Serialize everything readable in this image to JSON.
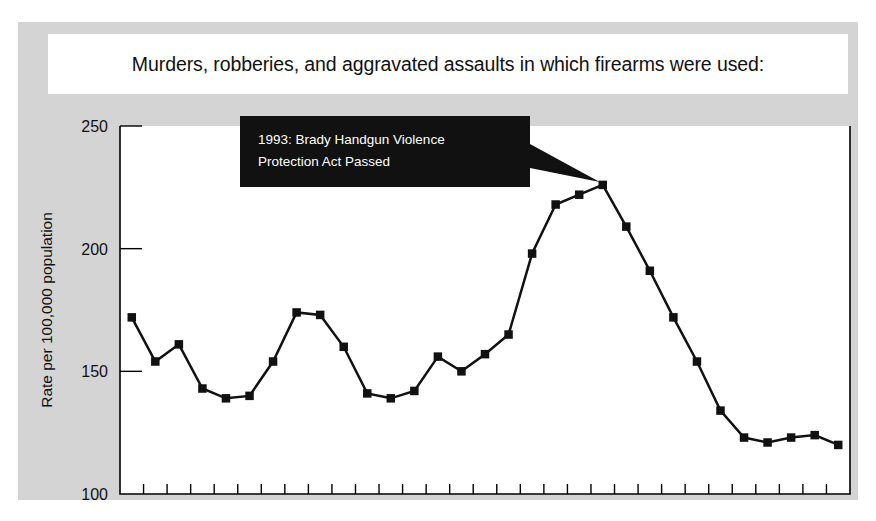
{
  "figure": {
    "title": "Murders, robberies, and aggravated assaults in which firearms were used:",
    "background_color": "#d4d4d4",
    "plot_background_color": "#ffffff",
    "line_color": "#111111",
    "marker_color": "#111111",
    "callout_background_color": "#111111",
    "callout_text_color": "#ffffff"
  },
  "annotation": {
    "line1": "1993: Brady Handgun Violence",
    "line2": "Protection Act Passed",
    "target_year": "'93"
  },
  "chart_data": {
    "type": "line",
    "title": "Murders, robberies, and aggravated assaults in which firearms were used:",
    "xlabel": "",
    "ylabel": "Rate per 100,000 population",
    "ylim": [
      100,
      250
    ],
    "yticks": [
      100,
      150,
      200,
      250
    ],
    "ytick_labels": [
      "100",
      "150",
      "200",
      "250"
    ],
    "grid": false,
    "legend": "none",
    "categories": [
      "'73",
      "'74",
      "'75",
      "'76",
      "'77",
      "'78",
      "'79",
      "'80",
      "'81",
      "'82",
      "'83",
      "'84",
      "'85",
      "'86",
      "'87",
      "'88",
      "'89",
      "'90",
      "'91",
      "'92",
      "'93",
      "'94",
      "'95",
      "'96",
      "'97",
      "'98",
      "'99",
      "'00",
      "'01",
      "'02",
      "'03"
    ],
    "values": [
      172,
      154,
      161,
      143,
      139,
      140,
      154,
      174,
      173,
      160,
      141,
      139,
      142,
      156,
      150,
      157,
      165,
      198,
      218,
      222,
      226,
      209,
      191,
      172,
      154,
      134,
      123,
      121,
      123,
      124,
      120
    ],
    "series": [
      {
        "name": "Firearm violent crime rate",
        "values": [
          172,
          154,
          161,
          143,
          139,
          140,
          154,
          174,
          173,
          160,
          141,
          139,
          142,
          156,
          150,
          157,
          165,
          198,
          218,
          222,
          226,
          209,
          191,
          172,
          154,
          134,
          123,
          121,
          123,
          124,
          120
        ]
      }
    ],
    "annotations": [
      {
        "text": "1993: Brady Handgun Violence Protection Act Passed",
        "x": "'93",
        "y": 226
      }
    ]
  }
}
